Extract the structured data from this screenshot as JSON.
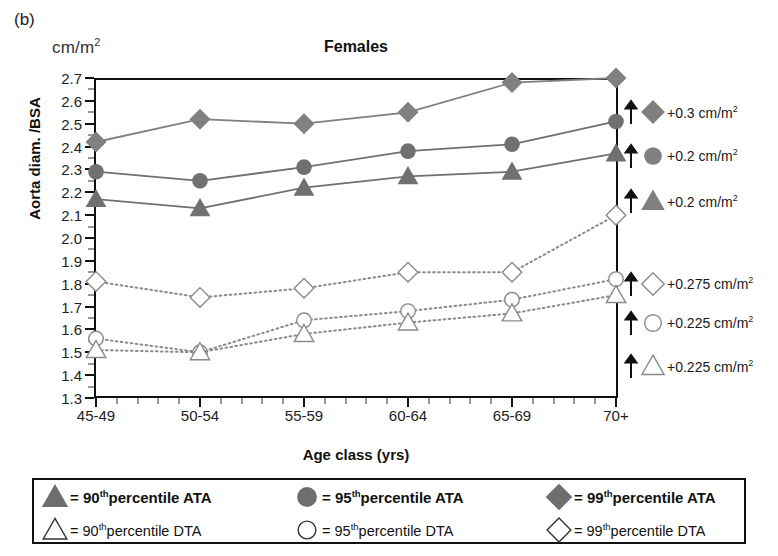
{
  "panel": {
    "letter": "(b)"
  },
  "axes": {
    "unit_label_prefix": "cm/m",
    "unit_label_sup": "2",
    "ylabel": "Aorta diam. /BSA",
    "xlabel": "Age class (yrs)"
  },
  "chart_data": {
    "type": "line",
    "title": "Females",
    "xlabel": "Age class (yrs)",
    "ylabel": "Aorta diam. /BSA",
    "yunit": "cm/m2",
    "ylim": [
      1.3,
      2.7
    ],
    "ytick_step": 0.1,
    "yticks": [
      "2.7",
      "2.6",
      "2.5",
      "2.4",
      "2.3",
      "2.2",
      "2.1",
      "2.0",
      "1.9",
      "1.8",
      "1.7",
      "1.6",
      "1.5",
      "1.4",
      "1.3"
    ],
    "grid": false,
    "legend_position": "below-plot-boxed",
    "categories": [
      "45-49",
      "50-54",
      "55-59",
      "60-64",
      "65-69",
      "70+"
    ],
    "series": [
      {
        "name": "99th percentile ATA",
        "marker": "diamond",
        "fill": "filled",
        "line": "solid",
        "color": "#808080",
        "values": [
          2.42,
          2.52,
          2.5,
          2.55,
          2.68,
          2.7
        ]
      },
      {
        "name": "95th percentile ATA",
        "marker": "circle",
        "fill": "filled",
        "line": "solid",
        "color": "#707070",
        "values": [
          2.29,
          2.25,
          2.31,
          2.38,
          2.41,
          2.51
        ]
      },
      {
        "name": "90th percentile ATA",
        "marker": "triangle",
        "fill": "filled",
        "line": "solid",
        "color": "#707070",
        "values": [
          2.17,
          2.13,
          2.22,
          2.27,
          2.29,
          2.37
        ]
      },
      {
        "name": "99th percentile DTA",
        "marker": "diamond",
        "fill": "open",
        "line": "dotted",
        "color": "#8a8a8a",
        "values": [
          1.81,
          1.74,
          1.78,
          1.85,
          1.85,
          2.1
        ]
      },
      {
        "name": "95th percentile DTA",
        "marker": "circle",
        "fill": "open",
        "line": "dotted",
        "color": "#8a8a8a",
        "values": [
          1.56,
          1.5,
          1.64,
          1.68,
          1.73,
          1.82
        ]
      },
      {
        "name": "90th percentile DTA",
        "marker": "triangle",
        "fill": "open",
        "line": "dotted",
        "color": "#8a8a8a",
        "values": [
          1.51,
          1.5,
          1.58,
          1.63,
          1.67,
          1.75
        ]
      }
    ],
    "annotations": [
      {
        "marker": "diamond",
        "fill": "filled",
        "at": 2.55,
        "text": "+0.3 cm/m",
        "sup": "2"
      },
      {
        "marker": "circle",
        "fill": "filled",
        "at": 2.36,
        "text": "+0.2 cm/m",
        "sup": "2"
      },
      {
        "marker": "triangle",
        "fill": "filled",
        "at": 2.16,
        "text": "+0.2 cm/m",
        "sup": "2"
      },
      {
        "marker": "diamond",
        "fill": "open",
        "at": 1.8,
        "text": "+0.275 cm/m",
        "sup": "2"
      },
      {
        "marker": "circle",
        "fill": "open",
        "at": 1.63,
        "text": "+0.225 cm/m",
        "sup": "2"
      },
      {
        "marker": "triangle",
        "fill": "open",
        "at": 1.44,
        "text": "+0.225 cm/m",
        "sup": "2"
      }
    ]
  },
  "legend": {
    "rows": [
      [
        {
          "marker": "triangle",
          "fill": "filled",
          "eq": "= 90",
          "sup": "th",
          "rest": "percentile ATA"
        },
        {
          "marker": "circle",
          "fill": "filled",
          "eq": "= 95",
          "sup": "th",
          "rest": "percentile ATA"
        },
        {
          "marker": "diamond",
          "fill": "filled",
          "eq": "= 99",
          "sup": "th",
          "rest": "percentile ATA"
        }
      ],
      [
        {
          "marker": "triangle",
          "fill": "open",
          "eq": "= 90",
          "sup": "th",
          "rest": "percentile DTA"
        },
        {
          "marker": "circle",
          "fill": "open",
          "eq": "= 95",
          "sup": "th",
          "rest": "percentile DTA"
        },
        {
          "marker": "diamond",
          "fill": "open",
          "eq": "= 99",
          "sup": "th",
          "rest": "percentile DTA"
        }
      ]
    ]
  }
}
